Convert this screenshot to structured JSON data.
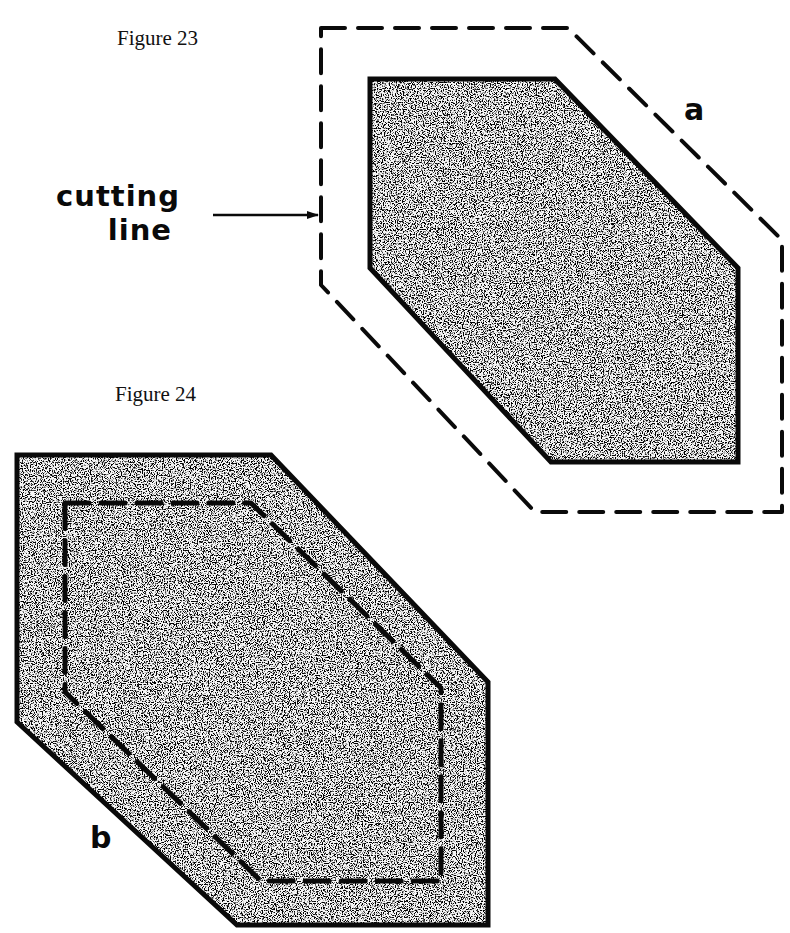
{
  "figures": [
    {
      "id": "figure-23",
      "caption": "Figure 23",
      "part_label": "a",
      "description": "Hexagonal fabric piece (shaded) with dashed cutting line drawn around it, outside the shape",
      "outer_outline": {
        "style": "dashed",
        "points": [
          [
            321,
            28
          ],
          [
            568,
            28
          ],
          [
            782,
            240
          ],
          [
            782,
            512
          ],
          [
            535,
            512
          ],
          [
            321,
            285
          ]
        ]
      },
      "inner_shape": {
        "style": "solid",
        "fill": "stipple",
        "points": [
          [
            370,
            79
          ],
          [
            555,
            79
          ],
          [
            738,
            268
          ],
          [
            738,
            462
          ],
          [
            551,
            462
          ],
          [
            370,
            268
          ]
        ]
      }
    },
    {
      "id": "figure-24",
      "caption": "Figure 24",
      "part_label": "b",
      "description": "Shaded hexagonal fabric piece with a dashed line drawn inside the shape",
      "outer_shape": {
        "style": "solid",
        "fill": "stipple",
        "points": [
          [
            17,
            455
          ],
          [
            271,
            455
          ],
          [
            488,
            682
          ],
          [
            488,
            925
          ],
          [
            237,
            925
          ],
          [
            17,
            722
          ]
        ]
      },
      "inner_outline": {
        "style": "dashed",
        "points": [
          [
            65,
            503
          ],
          [
            251,
            503
          ],
          [
            441,
            688
          ],
          [
            441,
            881
          ],
          [
            261,
            881
          ],
          [
            65,
            692
          ]
        ]
      }
    }
  ],
  "annotation": {
    "label_line1": "cutting",
    "label_line2": "line",
    "arrow_target": "figure-23 dashed outline"
  },
  "colors": {
    "ink": "#0a0a0a",
    "background": "#ffffff",
    "stipple_light": "#f4f4f4",
    "stipple_dark": "#1a1a1a"
  }
}
